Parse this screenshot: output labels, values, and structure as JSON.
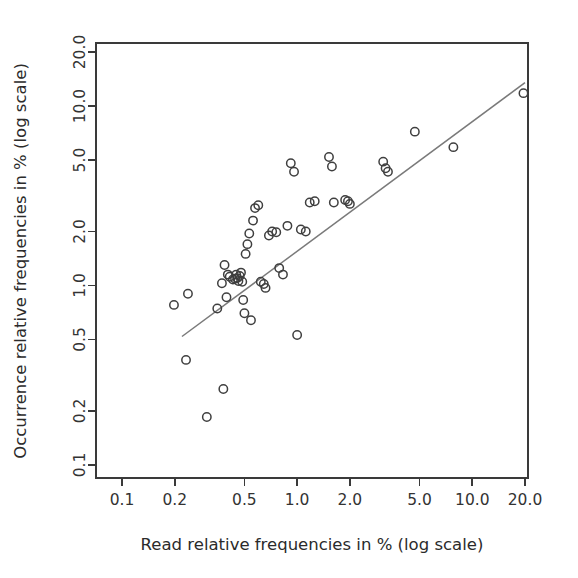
{
  "chart_data": {
    "type": "scatter",
    "title": "",
    "xlabel": "Read relative frequencies in % (log scale)",
    "ylabel": "Occurrence relative frequencies in % (log scale)",
    "xscale": "log",
    "yscale": "log",
    "xlim": [
      0.1,
      20.0
    ],
    "ylim": [
      0.1,
      20.0
    ],
    "xticks": [
      0.1,
      0.2,
      0.5,
      1.0,
      2.0,
      5.0,
      10.0,
      20.0
    ],
    "xticklabels": [
      "0.1",
      "0.2",
      "0.5",
      "1.0",
      "2.0",
      "5.0",
      "10.0",
      "20.0"
    ],
    "yticks": [
      0.1,
      0.2,
      0.5,
      1.0,
      2.0,
      5.0,
      10.0,
      20.0
    ],
    "yticklabels": [
      "0.1",
      "0.2",
      "0.5",
      "1.0",
      "2.0",
      "5.0",
      "10.0",
      "20.0"
    ],
    "grid": false,
    "legend": false,
    "marker": "open-circle",
    "marker_color": "#3f3f3f",
    "line_color": "#7a7a7a",
    "series": [
      {
        "name": "samples",
        "x": [
          0.198,
          0.232,
          0.238,
          0.305,
          0.35,
          0.372,
          0.379,
          0.385,
          0.395,
          0.402,
          0.412,
          0.43,
          0.442,
          0.449,
          0.455,
          0.462,
          0.47,
          0.478,
          0.486,
          0.492,
          0.5,
          0.508,
          0.52,
          0.533,
          0.545,
          0.56,
          0.575,
          0.6,
          0.62,
          0.645,
          0.66,
          0.69,
          0.72,
          0.76,
          0.79,
          0.83,
          0.88,
          0.92,
          0.96,
          1.0,
          1.05,
          1.12,
          1.18,
          1.26,
          1.52,
          1.58,
          1.62,
          1.88,
          1.95,
          2.0,
          3.1,
          3.2,
          3.3,
          4.7,
          7.8,
          19.6
        ],
        "y": [
          0.78,
          0.385,
          0.9,
          0.185,
          0.745,
          1.03,
          0.265,
          1.3,
          0.86,
          1.15,
          1.12,
          1.08,
          1.09,
          1.15,
          1.1,
          1.06,
          1.13,
          1.18,
          1.05,
          0.83,
          0.7,
          1.5,
          1.7,
          1.95,
          0.64,
          2.3,
          2.7,
          2.8,
          1.05,
          1.02,
          0.97,
          1.9,
          2.0,
          1.98,
          1.25,
          1.15,
          2.15,
          4.8,
          4.3,
          0.53,
          2.05,
          2.0,
          2.9,
          2.95,
          5.2,
          4.6,
          2.9,
          3.0,
          2.95,
          2.85,
          4.9,
          4.5,
          4.3,
          7.2,
          5.9,
          11.8
        ],
        "n_points": 56
      }
    ],
    "fit_line": {
      "name": "regression line",
      "x_start": 0.22,
      "y_start": 0.52,
      "x_end": 20.0,
      "y_end": 13.5,
      "color": "#7a7a7a"
    }
  },
  "axes": {
    "x_title": "Read relative frequencies in % (log scale)",
    "y_title": "Occurrence relative frequencies in % (log scale)"
  }
}
